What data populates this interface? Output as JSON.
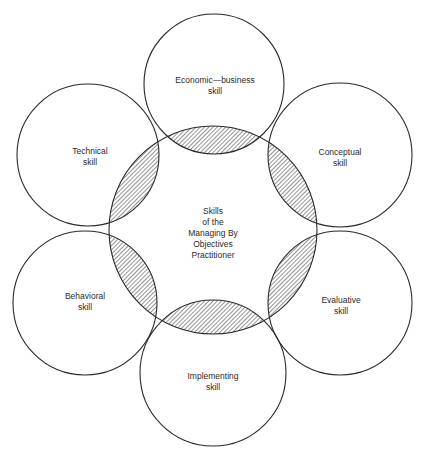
{
  "diagram": {
    "title": "Skills of the Managing By Objectives Practitioner",
    "center": {
      "lines": [
        "Skills",
        "of the",
        "Managing By",
        "Objectives",
        "Practitioner"
      ]
    },
    "skills": [
      {
        "id": "economic-business",
        "lines": [
          "Economic—business",
          "skill"
        ]
      },
      {
        "id": "conceptual",
        "lines": [
          "Conceptual",
          "skill"
        ]
      },
      {
        "id": "evaluative",
        "lines": [
          "Evaluative",
          "skill"
        ]
      },
      {
        "id": "implementing",
        "lines": [
          "Implementing",
          "skill"
        ]
      },
      {
        "id": "behavioral",
        "lines": [
          "Behavioral",
          "skill"
        ]
      },
      {
        "id": "technical",
        "lines": [
          "Technical",
          "skill"
        ]
      }
    ],
    "colors": {
      "stroke": "#2a2a2a",
      "hatch": "#3a3a3a",
      "background": "#ffffff"
    }
  }
}
